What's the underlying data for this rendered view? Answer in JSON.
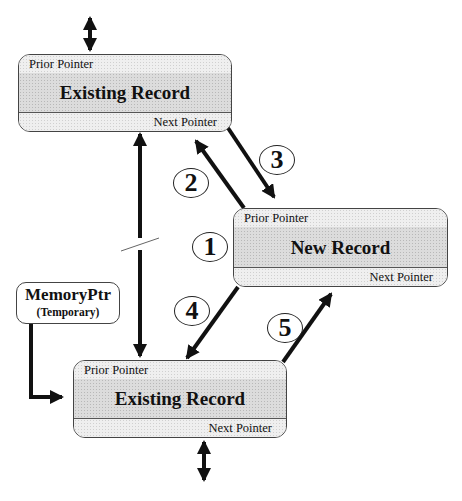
{
  "diagram": {
    "type": "doubly-linked-list-insertion",
    "records": [
      {
        "id": "top",
        "prior_label": "Prior Pointer",
        "title": "Existing Record",
        "next_label": "Next Pointer"
      },
      {
        "id": "new",
        "prior_label": "Prior Pointer",
        "title": "New Record",
        "next_label": "Next Pointer"
      },
      {
        "id": "bottom",
        "prior_label": "Prior Pointer",
        "title": "Existing Record",
        "next_label": "Next Pointer"
      }
    ],
    "memory_pointer": {
      "title": "MemoryPtr",
      "subtitle": "(Temporary)"
    },
    "steps": [
      {
        "label": "1",
        "from": "",
        "to": "new"
      },
      {
        "label": "2",
        "from": "new.prior",
        "to": "top.next"
      },
      {
        "label": "3",
        "from": "top.next",
        "to": "new.prior"
      },
      {
        "label": "4",
        "from": "new.next",
        "to": "bottom.prior"
      },
      {
        "label": "5",
        "from": "bottom.next",
        "to": "new.next"
      }
    ],
    "links": [
      {
        "from": "top.next",
        "to": "bottom.prior",
        "style": "double-arrow",
        "broken": true
      },
      {
        "from": "memory_pointer",
        "to": "bottom",
        "style": "elbow-arrow"
      },
      {
        "from": "top.prior",
        "to": "external",
        "style": "double-arrow"
      },
      {
        "from": "bottom.next",
        "to": "external",
        "style": "double-arrow"
      }
    ]
  }
}
